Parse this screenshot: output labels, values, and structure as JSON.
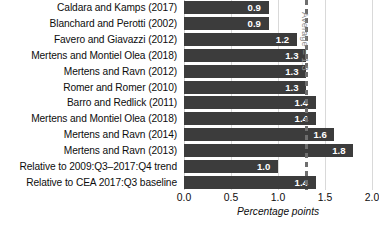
{
  "chart_data": {
    "type": "bar",
    "orientation": "horizontal",
    "title": "",
    "xlabel": "Percentage points",
    "ylabel": "",
    "xlim": [
      0.0,
      2.0
    ],
    "xticks": [
      "0.0",
      "0.5",
      "1.0",
      "1.5",
      "2.0"
    ],
    "xtick_values": [
      0.0,
      0.5,
      1.0,
      1.5,
      2.0
    ],
    "grid": true,
    "grid_axis": "x",
    "legend": "none",
    "bar_color": "#3c3c3c",
    "value_label_color": "#ffffff",
    "gridline_color": "#d9d9d9",
    "categories": [
      "Caldara and Kamps (2017)",
      "Blanchard and Perotti (2002)",
      "Favero and Giavazzi (2012)",
      "Mertens and Montiel Olea (2018)",
      "Mertens and Ravn (2012)",
      "Romer and Romer (2010)",
      "Barro and Redlick (2011)",
      "Mertens and Montiel Olea (2018)",
      "Mertens and Ravn (2014)",
      "Mertens and Ravn (2013)",
      "Relative to 2009:Q3–2017:Q4 trend",
      "Relative to CEA 2017:Q3 baseline"
    ],
    "values": [
      0.9,
      0.9,
      1.2,
      1.3,
      1.3,
      1.3,
      1.4,
      1.4,
      1.6,
      1.8,
      1.0,
      1.4
    ],
    "value_labels": [
      "0.9",
      "0.9",
      "1.2",
      "1.3",
      "1.3",
      "1.3",
      "1.4",
      "1.4",
      "1.6",
      "1.8",
      "1.0",
      "1.4"
    ],
    "annotations": [
      {
        "name": "average-reference-line",
        "label": "Average = 1.3",
        "value": 1.3,
        "style": "dashed-vertical",
        "color": "#6e6e6e",
        "text_color": "#8a8a8a",
        "rotation": 90
      }
    ]
  }
}
